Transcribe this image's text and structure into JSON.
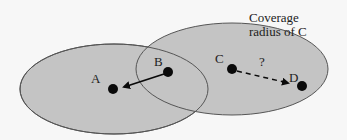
{
  "diagram": {
    "colors": {
      "region_fill": "#c4c4c4",
      "region_stroke": "#555555",
      "node": "#0a0a0a",
      "background": "#f7f7f7"
    },
    "regions": [
      {
        "id": "coverage-left",
        "label": ""
      },
      {
        "id": "coverage-c",
        "label": "Coverage radius of C"
      }
    ],
    "coverage_label_line1": "Coverage",
    "coverage_label_line2": "radius of C",
    "nodes": [
      {
        "id": "A",
        "label": "A"
      },
      {
        "id": "B",
        "label": "B"
      },
      {
        "id": "C",
        "label": "C"
      },
      {
        "id": "D",
        "label": "D"
      }
    ],
    "edges": [
      {
        "from": "B",
        "to": "A",
        "style": "solid",
        "label": ""
      },
      {
        "from": "C",
        "to": "D",
        "style": "dashed",
        "label": "?"
      }
    ],
    "question_mark": "?"
  }
}
